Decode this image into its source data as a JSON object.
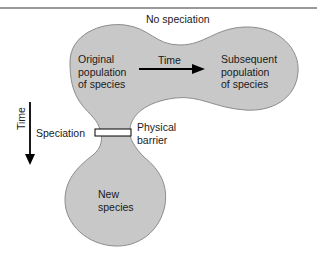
{
  "figure": {
    "top_label": "No speciation",
    "original": "Original\npopulation\nof species",
    "arrow_time": "Time",
    "subsequent": "Subsequent\npopulation\nof species",
    "vertical_time": "Time",
    "speciation": "Speciation",
    "barrier": "Physical\nbarrier",
    "new_species": "New\nspecies"
  },
  "colors": {
    "blob_fill": "#c8c8c8",
    "blob_stroke": "#8c8c8c",
    "text": "#1a1a1a"
  }
}
